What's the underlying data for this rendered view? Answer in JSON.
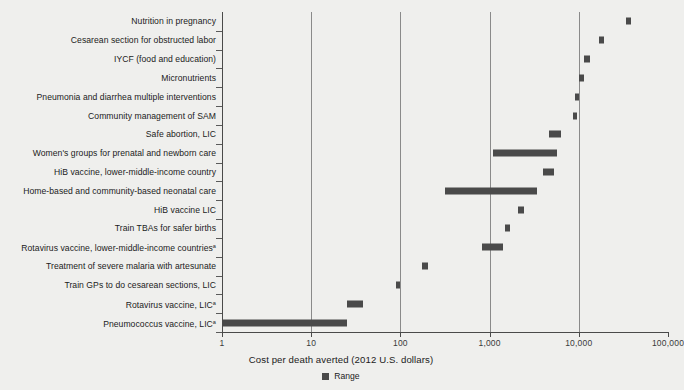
{
  "chart_data": {
    "type": "bar",
    "orientation": "horizontal",
    "title": "",
    "xlabel": "Cost per death averted (2012 U.S. dollars)",
    "ylabel": "",
    "xscale": "log",
    "xlim": [
      1,
      100000
    ],
    "xticks": [
      1,
      10,
      100,
      1000,
      10000,
      100000
    ],
    "xticklabels": [
      "1",
      "10",
      "100",
      "1,000",
      "10,000",
      "100,000"
    ],
    "grid": "vertical-only",
    "legend": {
      "position": "bottom-center",
      "entries": [
        "Range"
      ]
    },
    "legend_label": "Range",
    "categories": [
      "Nutrition in pregnancy",
      "Cesarean section for obstructed labor",
      "IYCF (food and education)",
      "Micronutrients",
      "Pneumonia and diarrhea multiple interventions",
      "Community management of SAM",
      "Safe abortion, LIC",
      "Women's groups for prenatal and newborn care",
      "HiB vaccine, lower-middle-income country",
      "Home-based and community-based neonatal care",
      "HiB vaccine LIC",
      "Train TBAs for safer births",
      "Rotavirus vaccine, lower-middle-income countries",
      "Treatment of severe malaria with artesunate",
      "Train GPs to do cesarean sections, LIC",
      "Rotavirus vaccine, LIC",
      "Pneumococcus vaccine, LIC"
    ],
    "footnote_markers": [
      "",
      "",
      "",
      "",
      "",
      "",
      "",
      "",
      "",
      "",
      "",
      "",
      "a",
      "",
      "",
      "a",
      "a"
    ],
    "ranges": [
      {
        "category": "Nutrition in pregnancy",
        "low": 34000,
        "high": 38000
      },
      {
        "category": "Cesarean section for obstructed labor",
        "low": 17000,
        "high": 19000
      },
      {
        "category": "IYCF (food and education)",
        "low": 11500,
        "high": 13500
      },
      {
        "category": "Micronutrients",
        "low": 10000,
        "high": 11500
      },
      {
        "category": "Pneumonia and diarrhea multiple interventions",
        "low": 9000,
        "high": 10000
      },
      {
        "category": "Community management of SAM",
        "low": 8500,
        "high": 9500
      },
      {
        "category": "Safe abortion, LIC",
        "low": 4600,
        "high": 6400
      },
      {
        "category": "Women's groups for prenatal and newborn care",
        "low": 1100,
        "high": 5700
      },
      {
        "category": "HiB vaccine, lower-middle-income country",
        "low": 4000,
        "high": 5300
      },
      {
        "category": "Home-based and community-based neonatal care",
        "low": 320,
        "high": 3400
      },
      {
        "category": "HiB vaccine LIC",
        "low": 2100,
        "high": 2400
      },
      {
        "category": "Train TBAs for safer births",
        "low": 1500,
        "high": 1700
      },
      {
        "category": "Rotavirus vaccine, lower-middle-income countries",
        "low": 820,
        "high": 1400
      },
      {
        "category": "Treatment of severe malaria with artesunate",
        "low": 175,
        "high": 205
      },
      {
        "category": "Train GPs to do cesarean sections, LIC",
        "low": 90,
        "high": 100
      },
      {
        "category": "Rotavirus vaccine, LIC",
        "low": 25,
        "high": 38
      },
      {
        "category": "Pneumococcus vaccine, LIC",
        "low": 1,
        "high": 25
      }
    ]
  }
}
